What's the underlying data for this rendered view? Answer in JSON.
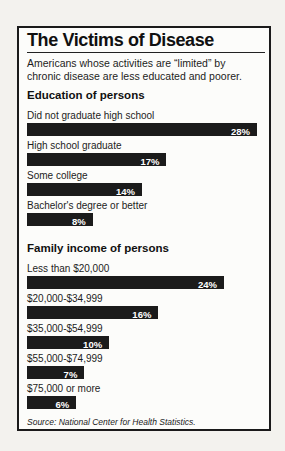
{
  "chart_data": {
    "type": "bar",
    "orientation": "horizontal",
    "title": "The Victims of Disease",
    "subtitle": "Americans whose activities are “limited” by\nchronic disease are less educated and poorer.",
    "source": "Source: National Center for Health Statistics.",
    "unit": "%",
    "xlim": [
      0,
      29
    ],
    "grid": false,
    "legend": false,
    "bar_color": "#1b1b1b",
    "value_label_color": "#ffffff",
    "frame_border_color": "#1a1a1a",
    "groups": [
      {
        "label": "Education of persons",
        "categories": [
          "Did not graduate high school",
          "High school graduate",
          "Some college",
          "Bachelor's degree or better"
        ],
        "values": [
          28,
          17,
          14,
          8
        ]
      },
      {
        "label": "Family income of persons",
        "categories": [
          "Less than $20,000",
          "$20,000-$34,999",
          "$35,000-$54,999",
          "$55,000-$74,999",
          "$75,000 or more"
        ],
        "values": [
          24,
          16,
          10,
          7,
          6
        ]
      }
    ]
  }
}
